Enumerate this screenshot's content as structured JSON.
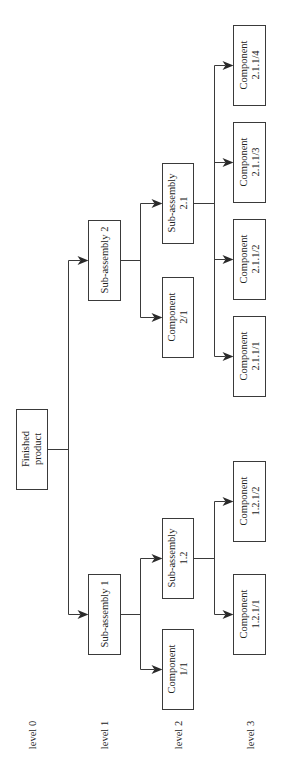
{
  "diagram": {
    "type": "product-structure-tree",
    "orientation": "rotated-90-ccw",
    "colors": {
      "line": "#3a3a3a",
      "text": "#222222",
      "background": "#ffffff"
    },
    "levels": [
      {
        "id": "level0",
        "label": "level 0",
        "x": 32
      },
      {
        "id": "level1",
        "label": "level 1",
        "x": 104
      },
      {
        "id": "level2",
        "label": "level 2",
        "x": 178
      },
      {
        "id": "level3",
        "label": "level 3",
        "x": 250
      }
    ],
    "nodes": [
      {
        "id": "fp",
        "lines": [
          "Finished",
          "product"
        ],
        "level": 0,
        "x": 16,
        "y": 409,
        "w": 31,
        "h": 80
      },
      {
        "id": "sa1",
        "lines": [
          "Sub-assembly 1"
        ],
        "level": 1,
        "x": 88,
        "y": 574,
        "w": 32,
        "h": 80
      },
      {
        "id": "sa2",
        "lines": [
          "Sub-assembly 2"
        ],
        "level": 1,
        "x": 88,
        "y": 220,
        "w": 32,
        "h": 80
      },
      {
        "id": "c1_1",
        "lines": [
          "Component",
          "1/1"
        ],
        "level": 2,
        "x": 162,
        "y": 629,
        "w": 31,
        "h": 80
      },
      {
        "id": "sa1_2",
        "lines": [
          "Sub-assembly",
          "1.2"
        ],
        "level": 2,
        "x": 162,
        "y": 518,
        "w": 31,
        "h": 80
      },
      {
        "id": "c2_1",
        "lines": [
          "Component",
          "2/1"
        ],
        "level": 2,
        "x": 162,
        "y": 277,
        "w": 31,
        "h": 80
      },
      {
        "id": "sa2_1",
        "lines": [
          "Sub-assembly",
          "2.1"
        ],
        "level": 2,
        "x": 162,
        "y": 163,
        "w": 31,
        "h": 80
      },
      {
        "id": "c1_2_1_1",
        "lines": [
          "Component",
          "1.2.1/1"
        ],
        "level": 3,
        "x": 233,
        "y": 574,
        "w": 32,
        "h": 80
      },
      {
        "id": "c1_2_1_2",
        "lines": [
          "Component",
          "1.2.1/2"
        ],
        "level": 3,
        "x": 233,
        "y": 461,
        "w": 32,
        "h": 80
      },
      {
        "id": "c2_1_1_1",
        "lines": [
          "Component",
          "2.1.1/1"
        ],
        "level": 3,
        "x": 233,
        "y": 316,
        "w": 32,
        "h": 80
      },
      {
        "id": "c2_1_1_2",
        "lines": [
          "Component",
          "2.1.1/2"
        ],
        "level": 3,
        "x": 233,
        "y": 219,
        "w": 32,
        "h": 80
      },
      {
        "id": "c2_1_1_3",
        "lines": [
          "Component",
          "2.1.1/3"
        ],
        "level": 3,
        "x": 233,
        "y": 122,
        "w": 32,
        "h": 80
      },
      {
        "id": "c2_1_1_4",
        "lines": [
          "Component",
          "2.1.1/4"
        ],
        "level": 3,
        "x": 233,
        "y": 25,
        "w": 32,
        "h": 80
      }
    ],
    "edges": [
      {
        "parent": "fp",
        "busX": 68,
        "children": [
          "sa1",
          "sa2"
        ]
      },
      {
        "parent": "sa1",
        "busX": 140,
        "children": [
          "c1_1",
          "sa1_2"
        ]
      },
      {
        "parent": "sa2",
        "busX": 140,
        "children": [
          "c2_1",
          "sa2_1"
        ]
      },
      {
        "parent": "sa1_2",
        "busX": 214,
        "children": [
          "c1_2_1_1",
          "c1_2_1_2"
        ]
      },
      {
        "parent": "sa2_1",
        "busX": 214,
        "children": [
          "c2_1_1_1",
          "c2_1_1_2",
          "c2_1_1_3",
          "c2_1_1_4"
        ]
      }
    ]
  }
}
